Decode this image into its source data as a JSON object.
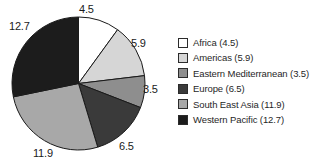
{
  "chart_data": {
    "type": "pie",
    "title": "",
    "total": 45.0,
    "start_angle_deg": 0,
    "direction": "clockwise",
    "grid": false,
    "legend_position": "right",
    "categories": [
      "Africa",
      "Americas",
      "Eastern Mediterranean",
      "Europe",
      "South East Asia",
      "Western Pacific"
    ],
    "values": [
      4.5,
      5.9,
      3.5,
      6.5,
      11.9,
      12.7
    ],
    "slice_colors": [
      "#ffffff",
      "#d6d6d6",
      "#8e8e8e",
      "#3a3a3a",
      "#a8a8a8",
      "#1c1c1c"
    ],
    "data_labels": [
      "4.5",
      "5.9",
      "3.5",
      "6.5",
      "11.9",
      "12.7"
    ],
    "legend_entries": [
      "Africa (4.5)",
      "Americas (5.9)",
      "Eastern Mediterranean (3.5)",
      "Europe (6.5)",
      "South East Asia (11.9)",
      "Western Pacific (12.7)"
    ]
  },
  "pie": {
    "labels": {
      "africa": "4.5",
      "americas": "5.9",
      "eastern_mediterranean": "3.5",
      "europe": "6.5",
      "south_east_asia": "11.9",
      "western_pacific": "12.7"
    }
  },
  "legend": {
    "items": [
      {
        "label": "Africa (4.5)",
        "color": "#ffffff"
      },
      {
        "label": "Americas (5.9)",
        "color": "#d6d6d6"
      },
      {
        "label": "Eastern Mediterranean (3.5)",
        "color": "#8e8e8e"
      },
      {
        "label": "Europe (6.5)",
        "color": "#3a3a3a"
      },
      {
        "label": "South East Asia (11.9)",
        "color": "#a8a8a8"
      },
      {
        "label": "Western Pacific (12.7)",
        "color": "#1c1c1c"
      }
    ]
  }
}
